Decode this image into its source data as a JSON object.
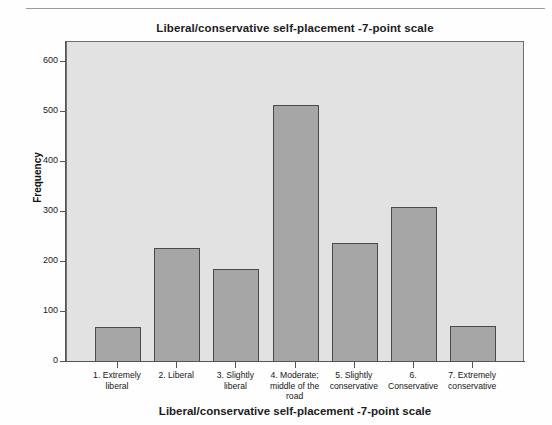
{
  "chart_data": {
    "type": "bar",
    "title": "Liberal/conservative self-placement -7-point scale",
    "xlabel": "Liberal/conservative self-placement -7-point scale",
    "ylabel": "Frequency",
    "categories": [
      "1. Extremely liberal",
      "2. Liberal",
      "3. Slightly liberal",
      "4. Moderate; middle of the road",
      "5. Slightly conservative",
      "6. Conservative",
      "7. Extremely conservative"
    ],
    "category_lines": [
      [
        "1. Extremely",
        "liberal"
      ],
      [
        "2. Liberal"
      ],
      [
        "3. Slightly",
        "liberal"
      ],
      [
        "4. Moderate;",
        "middle of the",
        "road"
      ],
      [
        "5. Slightly",
        "conservative"
      ],
      [
        "6.",
        "Conservative"
      ],
      [
        "7. Extremely",
        "conservative"
      ]
    ],
    "values": [
      70,
      229,
      187,
      515,
      238,
      311,
      72
    ],
    "ylim": [
      0,
      620
    ],
    "yticks": [
      0,
      100,
      200,
      300,
      400,
      500,
      600
    ],
    "ytick_labels": [
      "0",
      "100",
      "200",
      "300",
      "400",
      "500",
      "600"
    ],
    "grid": false,
    "legend": "none",
    "bar_color": "#a6a6a6",
    "bar_edge_color": "#4a4a4a",
    "plot_background": "#e2e2e2",
    "axis_color": "#555555"
  }
}
